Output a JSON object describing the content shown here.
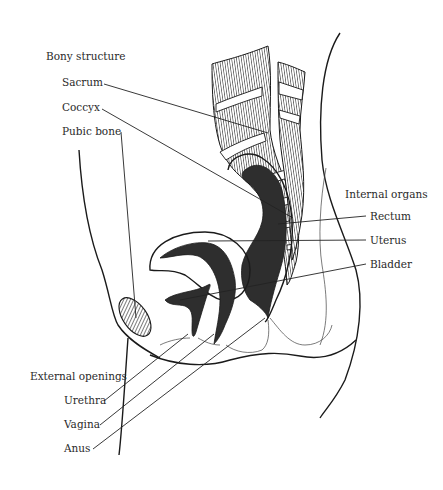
{
  "diagram": {
    "groups": {
      "bony": {
        "heading": "Bony structure",
        "labels": [
          "Sacrum",
          "Coccyx",
          "Pubic bone"
        ]
      },
      "internal": {
        "heading": "Internal organs",
        "labels": [
          "Rectum",
          "Uterus",
          "Bladder"
        ]
      },
      "external": {
        "heading": "External openings",
        "labels": [
          "Urethra",
          "Vagina",
          "Anus"
        ]
      }
    },
    "colors": {
      "ink": "#1a1a1a",
      "organ_fill": "#2e2e2e",
      "background": "#ffffff"
    }
  }
}
